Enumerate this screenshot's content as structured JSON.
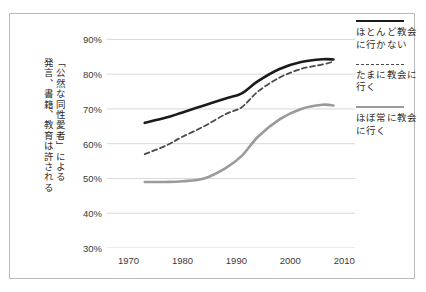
{
  "caption": {
    "columns": [
      "「公然な同性愛者」による",
      "発言、書籍、教育は許される"
    ],
    "full_text": "「公然な同性愛者」による発言、書籍、教育は許される"
  },
  "legend": {
    "items": [
      {
        "label_line1": "ほとんど教会",
        "label_line2": "に行かない",
        "style": "solid-black",
        "color": "#1b1b1b"
      },
      {
        "label_line1": "たまに教会に",
        "label_line2": "行く",
        "style": "dashed",
        "color": "#4a4a4a"
      },
      {
        "label_line1": "ほぼ常に教会",
        "label_line2": "に行く",
        "style": "solid-gray",
        "color": "#9a9a9a"
      }
    ]
  },
  "chart_data": {
    "type": "line",
    "title": "",
    "xlabel": "",
    "ylabel": "",
    "xlim": [
      1966,
      2012
    ],
    "ylim": [
      30,
      95
    ],
    "grid": true,
    "legend_position": "right",
    "xticks": [
      1970,
      1980,
      1990,
      2000,
      2010
    ],
    "xtick_labels": [
      "1970",
      "1980",
      "1990",
      "2000",
      "2010"
    ],
    "yticks": [
      30,
      40,
      50,
      60,
      70,
      80,
      90
    ],
    "ytick_labels": [
      "30%",
      "40%",
      "50%",
      "60%",
      "70%",
      "80%",
      "90%"
    ],
    "series": [
      {
        "name": "ほとんど教会に行かない",
        "color": "#1b1b1b",
        "style": "solid",
        "width": 2.6,
        "x": [
          1973,
          1977,
          1980,
          1984,
          1988,
          1991,
          1994,
          1998,
          2002,
          2006,
          2008
        ],
        "values": [
          66.0,
          67.5,
          69.0,
          71.0,
          73.0,
          74.5,
          78.0,
          81.5,
          83.5,
          84.3,
          84.2
        ]
      },
      {
        "name": "たまに教会に行く",
        "color": "#4a4a4a",
        "style": "dashed",
        "width": 1.8,
        "x": [
          1973,
          1977,
          1980,
          1984,
          1988,
          1991,
          1994,
          1998,
          2002,
          2006,
          2008
        ],
        "values": [
          57.0,
          59.5,
          62.0,
          65.0,
          68.5,
          70.5,
          75.0,
          79.0,
          81.5,
          82.8,
          83.6
        ]
      },
      {
        "name": "ほぼ常に教会に行く",
        "color": "#9a9a9a",
        "style": "solid",
        "width": 2.6,
        "x": [
          1973,
          1977,
          1980,
          1984,
          1988,
          1991,
          1994,
          1998,
          2002,
          2006,
          2008
        ],
        "values": [
          49.0,
          49.0,
          49.2,
          50.0,
          53.0,
          56.5,
          62.0,
          67.0,
          70.0,
          71.2,
          71.0
        ]
      }
    ]
  }
}
